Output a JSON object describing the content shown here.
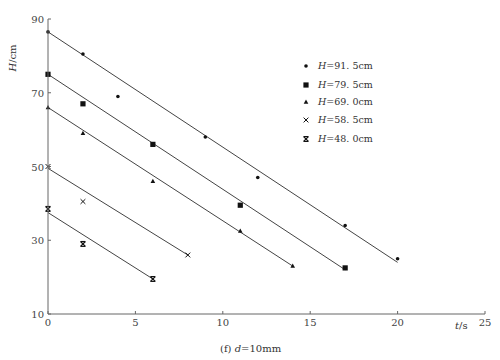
{
  "chart_data": {
    "type": "scatter",
    "title": "",
    "caption": "(f) d=10mm",
    "xlabel": "t/s",
    "ylabel": "H/cm",
    "xlim": [
      0,
      25
    ],
    "ylim": [
      10,
      90
    ],
    "x_ticks": [
      0,
      5,
      10,
      15,
      20,
      25
    ],
    "y_ticks": [
      10,
      30,
      50,
      70,
      90
    ],
    "grid": false,
    "legend_position": "upper right",
    "series": [
      {
        "name": "H=91.5cm",
        "marker": "dot",
        "points": [
          [
            0,
            86.5
          ],
          [
            2,
            80.5
          ],
          [
            4,
            69
          ],
          [
            9,
            58
          ],
          [
            12,
            47
          ],
          [
            17,
            34
          ],
          [
            20,
            25
          ]
        ],
        "fit_line": [
          [
            0,
            86.5
          ],
          [
            20,
            24
          ]
        ]
      },
      {
        "name": "H=79.5cm",
        "marker": "square",
        "points": [
          [
            0,
            75
          ],
          [
            2,
            67
          ],
          [
            6,
            56
          ],
          [
            11,
            39.5
          ],
          [
            17,
            22.5
          ]
        ],
        "fit_line": [
          [
            0,
            75
          ],
          [
            17,
            22
          ]
        ]
      },
      {
        "name": "H=69.0cm",
        "marker": "triangle",
        "points": [
          [
            0,
            66
          ],
          [
            2,
            59
          ],
          [
            6,
            46
          ],
          [
            11,
            32.5
          ],
          [
            14,
            23
          ]
        ],
        "fit_line": [
          [
            0,
            66
          ],
          [
            14,
            23
          ]
        ]
      },
      {
        "name": "H=58.5cm",
        "marker": "x",
        "points": [
          [
            0,
            50
          ],
          [
            2,
            40.5
          ],
          [
            8,
            26
          ]
        ],
        "fit_line": [
          [
            0,
            49.5
          ],
          [
            8,
            26
          ]
        ]
      },
      {
        "name": "H=48.0cm",
        "marker": "bowtie",
        "points": [
          [
            0,
            38.5
          ],
          [
            2,
            29
          ],
          [
            6,
            19.5
          ]
        ],
        "fit_line": [
          [
            0,
            37.5
          ],
          [
            6,
            19.5
          ]
        ]
      }
    ]
  },
  "legend": [
    {
      "prefix": "H",
      "text": "=91. 5cm"
    },
    {
      "prefix": "H",
      "text": "=79. 5cm"
    },
    {
      "prefix": "H",
      "text": "=69. 0cm"
    },
    {
      "prefix": "H",
      "text": "=58. 5cm"
    },
    {
      "prefix": "H",
      "text": "=48. 0cm"
    }
  ],
  "axes": {
    "x_label_var": "t",
    "x_label_unit": "/s",
    "y_label_var": "H",
    "y_label_unit": "/cm",
    "x_tick_labels": [
      "0",
      "5",
      "10",
      "15",
      "20",
      "25"
    ],
    "y_tick_labels": [
      "10",
      "30",
      "50",
      "70",
      "90"
    ]
  },
  "caption": {
    "prefix": "(f) ",
    "var": "d",
    "rest": "=10mm"
  }
}
